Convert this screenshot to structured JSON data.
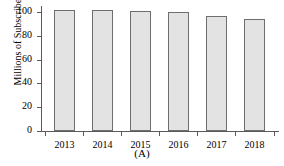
{
  "chart_data": {
    "type": "bar",
    "title": "",
    "subtitle": "",
    "xlabel": "",
    "ylabel": "Millions of Subscribers",
    "categories": [
      "2013",
      "2014",
      "2015",
      "2016",
      "2017",
      "2018"
    ],
    "values": [
      102,
      102,
      101,
      100,
      97,
      94
    ],
    "ylim": [
      0,
      110
    ],
    "yticks": [
      0,
      20,
      40,
      60,
      80,
      100
    ],
    "ytick_labels": [
      "0",
      "20",
      "40",
      "60",
      "80",
      "100"
    ],
    "grid": false,
    "legend": null,
    "legend_position": "none",
    "bar_fill_color": "#e3e3e3",
    "bar_edge_color": "#6e6e6e",
    "axis_color": "#5a5a5a"
  },
  "caption": {
    "text": "(A)"
  }
}
